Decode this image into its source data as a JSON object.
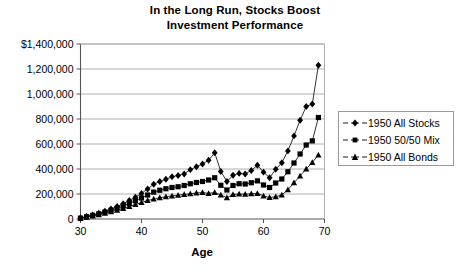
{
  "chart_data": {
    "type": "line",
    "title": "In the Long Run, Stocks Boost Investment Performance",
    "title_line1": "In the Long Run, Stocks Boost",
    "title_line2": "Investment Performance",
    "xlabel": "Age",
    "ylabel": "",
    "grid": true,
    "legend_position": "right",
    "xlim": [
      30,
      70
    ],
    "ylim": [
      0,
      1400000
    ],
    "xticks": [
      30,
      40,
      50,
      60,
      70
    ],
    "xtick_labels": [
      "30",
      "40",
      "50",
      "60",
      "70"
    ],
    "yticks": [
      0,
      200000,
      400000,
      600000,
      800000,
      1000000,
      1200000,
      1400000
    ],
    "ytick_labels": [
      "0",
      "200,000",
      "400,000",
      "600,000",
      "800,000",
      "1,000,000",
      "1,200,000",
      "$1,400,000"
    ],
    "x": [
      30,
      31,
      32,
      33,
      34,
      35,
      36,
      37,
      38,
      39,
      40,
      41,
      42,
      43,
      44,
      45,
      46,
      47,
      48,
      49,
      50,
      51,
      52,
      53,
      54,
      55,
      56,
      57,
      58,
      59,
      60,
      61,
      62,
      63,
      64,
      65,
      66,
      67,
      68,
      69
    ],
    "series": [
      {
        "name": "1950 All Stocks",
        "marker": "diamond",
        "values": [
          8000,
          20000,
          32000,
          46000,
          62000,
          80000,
          100000,
          122000,
          148000,
          175000,
          205000,
          240000,
          278000,
          300000,
          318000,
          338000,
          348000,
          360000,
          395000,
          418000,
          440000,
          470000,
          530000,
          380000,
          300000,
          350000,
          365000,
          360000,
          388000,
          430000,
          375000,
          330000,
          398000,
          450000,
          545000,
          665000,
          790000,
          900000,
          920000,
          1230000
        ]
      },
      {
        "name": "1950 50/50 Mix",
        "marker": "square",
        "values": [
          7000,
          18000,
          29000,
          41000,
          55000,
          70000,
          86000,
          104000,
          124000,
          146000,
          168000,
          192000,
          215000,
          230000,
          242000,
          252000,
          258000,
          268000,
          282000,
          292000,
          300000,
          312000,
          330000,
          270000,
          232000,
          268000,
          282000,
          280000,
          290000,
          305000,
          272000,
          252000,
          288000,
          320000,
          378000,
          448000,
          520000,
          592000,
          625000,
          812000
        ]
      },
      {
        "name": "1950 All Bonds",
        "marker": "triangle",
        "values": [
          6000,
          15000,
          25000,
          35000,
          46000,
          58000,
          71000,
          85000,
          100000,
          116000,
          132000,
          148000,
          160000,
          170000,
          178000,
          185000,
          190000,
          196000,
          202000,
          208000,
          212000,
          205000,
          212000,
          192000,
          170000,
          196000,
          200000,
          198000,
          202000,
          205000,
          185000,
          172000,
          178000,
          192000,
          235000,
          290000,
          345000,
          400000,
          452000,
          512000
        ]
      }
    ]
  },
  "legend": {
    "items": [
      {
        "label": "1950 All Stocks",
        "marker": "diamond-marker-icon"
      },
      {
        "label": "1950 50/50 Mix",
        "marker": "square-marker-icon"
      },
      {
        "label": "1950 All Bonds",
        "marker": "triangle-marker-icon"
      }
    ]
  },
  "colors": {
    "series": "#000000",
    "grid": "#b0b0b0",
    "axis": "#808080",
    "background": "#ffffff",
    "legend_border": "#9a9a9a"
  }
}
